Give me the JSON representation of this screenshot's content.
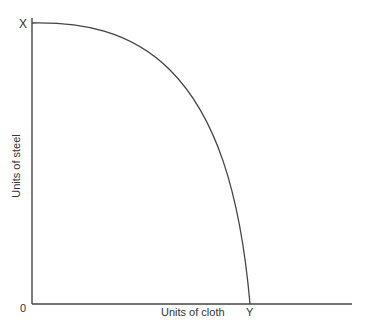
{
  "diagram": {
    "type": "production-possibility-frontier",
    "y_axis_label": "Units of steel",
    "x_axis_label": "Units of cloth",
    "origin_label": "0",
    "y_intercept_label": "X",
    "x_intercept_label": "Y",
    "line_color": "#444444"
  }
}
